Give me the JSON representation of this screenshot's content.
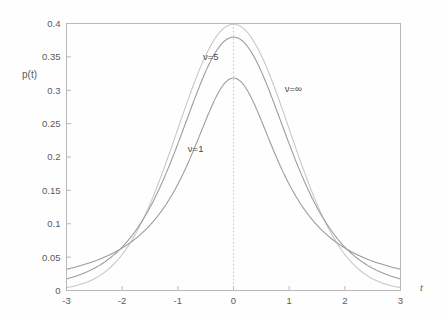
{
  "chart_data": {
    "type": "line",
    "title": "",
    "subtitle": "",
    "xlabel": "t",
    "ylabel": "p(t)",
    "xlim": [
      -3,
      3
    ],
    "ylim": [
      0,
      0.4
    ],
    "grid": false,
    "legend_position": "inline-annotations",
    "x_ticks": [
      "-3",
      "-2",
      "-1",
      "0",
      "1",
      "2",
      "3"
    ],
    "x_tick_values": [
      -3,
      -2,
      -1,
      0,
      1,
      2,
      3
    ],
    "y_ticks": [
      "0",
      "0.05",
      "0.1",
      "0.15",
      "0.2",
      "0.25",
      "0.3",
      "0.35",
      "0.4"
    ],
    "y_tick_values": [
      0,
      0.05,
      0.1,
      0.15,
      0.2,
      0.25,
      0.3,
      0.35,
      0.4
    ],
    "annotations": [
      {
        "text": "ν=5",
        "x": -0.55,
        "y": 0.345
      },
      {
        "text": "ν=∞",
        "x": 0.92,
        "y": 0.297
      },
      {
        "text": "ν=1",
        "x": -0.82,
        "y": 0.208
      }
    ],
    "reference_lines": [
      {
        "orientation": "vertical",
        "value": 0,
        "style": "dotted",
        "color": "#c3c3c3"
      }
    ],
    "series": [
      {
        "name": "ν=1",
        "distribution": "student-t",
        "nu": 1,
        "color": "#9a9a9a",
        "peak_value": 0.3183,
        "x": [
          -3,
          -2.5,
          -2,
          -1.5,
          -1,
          -0.5,
          0,
          0.5,
          1,
          1.5,
          2,
          2.5,
          3
        ],
        "values": [
          0.0318,
          0.0439,
          0.0637,
          0.0979,
          0.1592,
          0.2546,
          0.3183,
          0.2546,
          0.1592,
          0.0979,
          0.0637,
          0.0439,
          0.0318
        ]
      },
      {
        "name": "ν=5",
        "distribution": "student-t",
        "nu": 5,
        "color": "#9a9a9a",
        "peak_value": 0.3796,
        "x": [
          -3,
          -2.5,
          -2,
          -1.5,
          -1,
          -0.5,
          0,
          0.5,
          1,
          1.5,
          2,
          2.5,
          3
        ],
        "values": [
          0.0173,
          0.0336,
          0.0651,
          0.1245,
          0.2196,
          0.3279,
          0.3796,
          0.3279,
          0.2196,
          0.1245,
          0.0651,
          0.0336,
          0.0173
        ]
      },
      {
        "name": "ν=∞",
        "distribution": "normal",
        "nu": null,
        "color": "#c6c6c6",
        "peak_value": 0.3989,
        "x": [
          -3,
          -2.5,
          -2,
          -1.5,
          -1,
          -0.5,
          0,
          0.5,
          1,
          1.5,
          2,
          2.5,
          3
        ],
        "values": [
          0.0044,
          0.0175,
          0.054,
          0.1295,
          0.242,
          0.3521,
          0.3989,
          0.3521,
          0.242,
          0.1295,
          0.054,
          0.0175,
          0.0044
        ]
      }
    ]
  },
  "colors": {
    "background": "#fefefe",
    "frame": "#b9b9b9",
    "tick_text": "#5a5a5a",
    "annotation_text": "#4a4a4a",
    "zero_line": "#c3c3c3"
  }
}
